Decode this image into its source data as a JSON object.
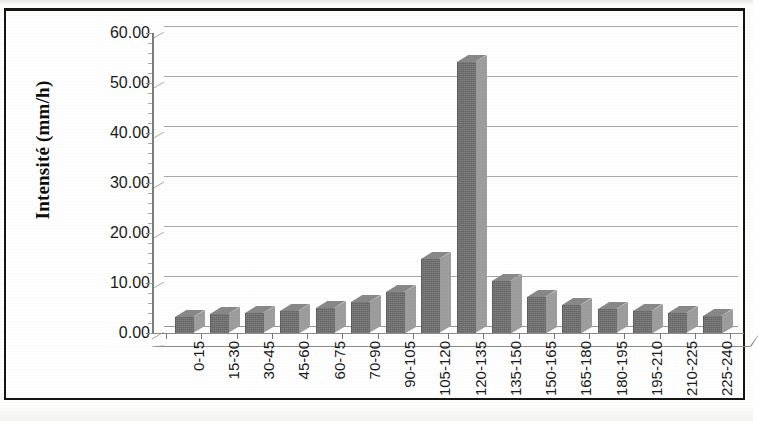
{
  "chart_data": {
    "type": "bar",
    "title": "",
    "xlabel": "",
    "ylabel": "Intensité (mm/h)",
    "ylim": [
      0,
      60
    ],
    "ytick_step": 10,
    "ytick_labels": [
      "60.00",
      "50.00",
      "40.00",
      "30.00",
      "20.00",
      "10.00",
      "0.00"
    ],
    "ytick_values": [
      60,
      50,
      40,
      30,
      20,
      10,
      0
    ],
    "grid": true,
    "legend": "none",
    "style": "3d-column",
    "bar_color": "#6f6f6f",
    "gridline_color": "#b4b4b0",
    "categories": [
      "0-15",
      "15-30",
      "30-45",
      "45-60",
      "60-75",
      "70-90",
      "90-105",
      "105-120",
      "120-135",
      "135-150",
      "150-165",
      "165-180",
      "180-195",
      "195-210",
      "210-225",
      "225-240"
    ],
    "values": [
      3.2,
      3.8,
      4.0,
      4.5,
      5.0,
      6.2,
      8.3,
      14.8,
      54.2,
      10.5,
      7.3,
      5.7,
      4.8,
      4.5,
      4.0,
      3.5
    ]
  },
  "axes": {
    "y_title": "Intensité (mm/h)"
  }
}
